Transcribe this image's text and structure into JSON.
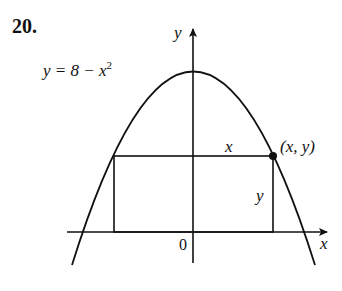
{
  "problem": {
    "number": "20."
  },
  "diagram": {
    "curve_label_lhs": "y = 8 − x",
    "curve_label_exp": "2",
    "axis_x_label": "x",
    "axis_y_label": "y",
    "origin_label": "0",
    "rect_width_label": "x",
    "rect_height_label": "y",
    "point_label": "(x, y)",
    "equation": "y = 8 - x^2",
    "colors": {
      "ink": "#111111",
      "background": "#ffffff"
    }
  }
}
